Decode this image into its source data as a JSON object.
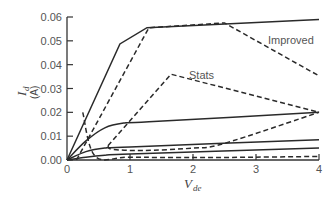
{
  "chart_data": {
    "type": "line",
    "title": "",
    "xlabel": "V_de",
    "ylabel": "I_d (A)",
    "xlim": [
      0,
      4
    ],
    "ylim": [
      0,
      0.06
    ],
    "xticks": [
      0,
      1,
      2,
      3,
      4
    ],
    "xtick_labels": [
      "0",
      "1",
      "2",
      "3",
      "4"
    ],
    "yticks": [
      0,
      0.01,
      0.02,
      0.03,
      0.04,
      0.05,
      0.06
    ],
    "ytick_labels": [
      "0.00",
      "0.01",
      "0.02",
      "0.03",
      "0.04",
      "0.05",
      "0.06"
    ],
    "grid": false,
    "legend": null,
    "annotations": [
      {
        "text": "Improved",
        "x": 3.2,
        "y": 0.05
      },
      {
        "text": "Stats",
        "x": 1.95,
        "y": 0.035
      }
    ],
    "series": [
      {
        "name": "solid-top",
        "style": "solid",
        "x": [
          0,
          0.84,
          1.27,
          4
        ],
        "y": [
          0,
          0.0487,
          0.0555,
          0.059
        ]
      },
      {
        "name": "Improved",
        "style": "dashed",
        "x": [
          0.15,
          1.3,
          2.5,
          4
        ],
        "y": [
          0,
          0.0555,
          0.0575,
          0.0353
        ]
      },
      {
        "name": "dashed-low",
        "style": "dashed",
        "x": [
          0.25,
          0.45,
          1.0,
          2.0,
          3.0,
          4.0
        ],
        "y": [
          0.02,
          0.0015,
          0.0012,
          0.001,
          0.0012,
          0.0015
        ]
      },
      {
        "name": "Stats",
        "style": "dashed",
        "x": [
          0.65,
          1.65,
          4
        ],
        "y": [
          0.006,
          0.036,
          0.02
        ]
      },
      {
        "name": "Stats-lower",
        "style": "dashed",
        "x": [
          0.65,
          0.72,
          1.2,
          2.0,
          2.5,
          4
        ],
        "y": [
          0.006,
          0.0045,
          0.004,
          0.005,
          0.007,
          0.02
        ]
      },
      {
        "name": "solid-mid",
        "style": "solid",
        "x": [
          0,
          0.3,
          0.6,
          0.9,
          1.3,
          4
        ],
        "y": [
          0,
          0.008,
          0.0135,
          0.0155,
          0.016,
          0.02
        ]
      },
      {
        "name": "solid-low",
        "style": "solid",
        "x": [
          0,
          0.3,
          0.6,
          1.0,
          4
        ],
        "y": [
          0,
          0.0035,
          0.005,
          0.0055,
          0.0085
        ]
      },
      {
        "name": "solid-lowest",
        "style": "solid",
        "x": [
          0,
          0.3,
          0.6,
          1.0,
          4
        ],
        "y": [
          0,
          0.0012,
          0.002,
          0.0025,
          0.005
        ]
      }
    ]
  },
  "labels": {
    "annot_improved": "Improved",
    "annot_stats": "Stats",
    "xlabel_main": "V",
    "xlabel_sub": "de",
    "ylabel_main": "I",
    "ylabel_sub": "d",
    "ylabel_unit": "(A)"
  }
}
